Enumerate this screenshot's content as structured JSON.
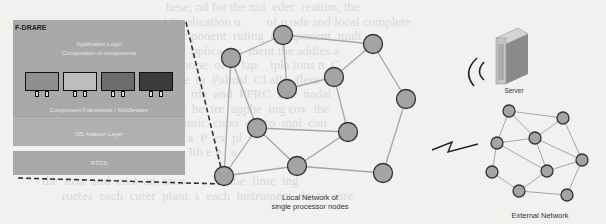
{
  "background_text_lines": [
    "                                                   hese, nd for the nul  eder  reation, the",
    "                                          s, and C  olication n        of n ode and local complete",
    "                                                    unc ponent  ruling  Component  mult",
    "                                                    ew  pplica  on  ment the addles a",
    "                                                       mone  of     lap    ipla ions n  C",
    "                                                    The  ra  Palmsl  Cl ally  fleur",
    "                                                    Ge  rda  and  PPRC  Poc  nadal",
    "                                                           he  ire  apphe  ing cov  the",
    "                                              a  dynamic  cupo  on  ro  mpl  can",
    "                                           P  SB  e  a  P  ex  pl",
    "                                                          Ith e e   a",
    "",
    "             the  tion  and  cost  an  inco          s  the  fime  ing",
    "                   ruetes  each  cuter  plant  s  each  instrument  de  to cure"
  ],
  "left_stack": {
    "title": "F-DRARE",
    "app_logic_line1": "Application Logic",
    "app_logic_line2": "Composition of components",
    "components": [
      {
        "name": "component-1",
        "color": "#8f8f8e"
      },
      {
        "name": "component-2",
        "color": "#bdbdbc"
      },
      {
        "name": "component-3",
        "color": "#6c6c6b"
      },
      {
        "name": "component-4",
        "color": "#3c3c3c"
      }
    ],
    "middleware_label": "Component Framework / Middleware",
    "os_adaptor_label": "OS Adaptor Layer",
    "rtos_label": "RTOS"
  },
  "local_network": {
    "label_line1": "Local Network of",
    "label_line2": "single processor nodes",
    "node_color": "#a4a4a3",
    "nodes": [
      {
        "id": "A",
        "x": 231,
        "y": 58
      },
      {
        "id": "B",
        "x": 283,
        "y": 35
      },
      {
        "id": "C",
        "x": 373,
        "y": 44
      },
      {
        "id": "D",
        "x": 287,
        "y": 89
      },
      {
        "id": "E",
        "x": 334,
        "y": 77
      },
      {
        "id": "F",
        "x": 406,
        "y": 99
      },
      {
        "id": "G",
        "x": 257,
        "y": 128
      },
      {
        "id": "H",
        "x": 348,
        "y": 132
      },
      {
        "id": "I",
        "x": 297,
        "y": 166
      },
      {
        "id": "J",
        "x": 224,
        "y": 176
      },
      {
        "id": "K",
        "x": 383,
        "y": 173
      }
    ],
    "edges": [
      [
        "A",
        "B"
      ],
      [
        "B",
        "C"
      ],
      [
        "B",
        "D"
      ],
      [
        "D",
        "E"
      ],
      [
        "E",
        "C"
      ],
      [
        "C",
        "F"
      ],
      [
        "F",
        "K"
      ],
      [
        "A",
        "J"
      ],
      [
        "A",
        "G"
      ],
      [
        "G",
        "H"
      ],
      [
        "G",
        "I"
      ],
      [
        "G",
        "J"
      ],
      [
        "H",
        "I"
      ],
      [
        "H",
        "E"
      ],
      [
        "J",
        "I"
      ],
      [
        "I",
        "K"
      ]
    ]
  },
  "server": {
    "label": "Server"
  },
  "external_network": {
    "label": "External Network",
    "nodes": [
      {
        "id": "a",
        "x": 509,
        "y": 111
      },
      {
        "id": "b",
        "x": 563,
        "y": 118
      },
      {
        "id": "c",
        "x": 535,
        "y": 138
      },
      {
        "id": "d",
        "x": 497,
        "y": 143
      },
      {
        "id": "e",
        "x": 582,
        "y": 160
      },
      {
        "id": "f",
        "x": 547,
        "y": 171
      },
      {
        "id": "g",
        "x": 492,
        "y": 172
      },
      {
        "id": "h",
        "x": 519,
        "y": 191
      },
      {
        "id": "i",
        "x": 567,
        "y": 195
      }
    ],
    "edges": [
      [
        "a",
        "b"
      ],
      [
        "a",
        "c"
      ],
      [
        "a",
        "d"
      ],
      [
        "b",
        "c"
      ],
      [
        "b",
        "e"
      ],
      [
        "c",
        "d"
      ],
      [
        "c",
        "f"
      ],
      [
        "c",
        "e"
      ],
      [
        "d",
        "f"
      ],
      [
        "d",
        "g"
      ],
      [
        "f",
        "e"
      ],
      [
        "f",
        "h"
      ],
      [
        "g",
        "h"
      ],
      [
        "h",
        "i"
      ],
      [
        "i",
        "e"
      ]
    ]
  }
}
